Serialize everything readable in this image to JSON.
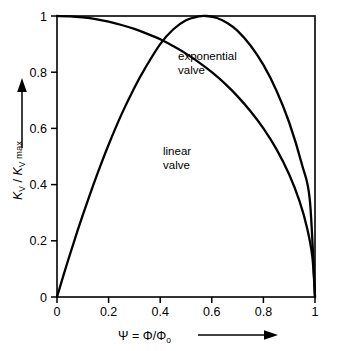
{
  "chart_data": {
    "type": "line",
    "title": "",
    "xlabel": "Ψ = Φ/Φ₀",
    "ylabel": "Kᵥ / Kᵥ max",
    "xlim": [
      0,
      1
    ],
    "ylim": [
      0,
      1
    ],
    "grid": false,
    "legend_position": "inline-annotations",
    "xticks": [
      "0",
      "0.2",
      "0.4",
      "0.6",
      "0.8",
      "1"
    ],
    "xtick_values": [
      0,
      0.2,
      0.4,
      0.6,
      0.8,
      1
    ],
    "yticks": [
      "0",
      "0.2",
      "0.4",
      "0.6",
      "0.8",
      "1"
    ],
    "ytick_values": [
      0,
      0.2,
      0.4,
      0.6,
      0.8,
      1
    ],
    "annotations": [
      {
        "text_line1": "exponential",
        "text_line2": "valve",
        "x": 0.47,
        "y": 0.885
      },
      {
        "text_line1": "linear",
        "text_line2": "valve",
        "x": 0.42,
        "y": 0.53
      }
    ],
    "series": [
      {
        "name": "linear valve",
        "label_line1": "linear",
        "label_line2": "valve",
        "color": "#000000",
        "x": [
          0.0,
          0.05,
          0.1,
          0.15,
          0.2,
          0.25,
          0.3,
          0.34,
          0.4,
          0.45,
          0.5,
          0.55,
          0.6,
          0.65,
          0.7,
          0.75,
          0.8,
          0.85,
          0.9,
          0.94,
          0.97,
          0.99,
          1.0
        ],
        "y": [
          1.0,
          0.999,
          0.995,
          0.989,
          0.98,
          0.968,
          0.954,
          0.94,
          0.917,
          0.893,
          0.866,
          0.835,
          0.8,
          0.76,
          0.714,
          0.661,
          0.6,
          0.527,
          0.436,
          0.341,
          0.243,
          0.141,
          0.0
        ]
      },
      {
        "name": "exponential valve",
        "label_line1": "exponential",
        "label_line2": "valve",
        "color": "#000000",
        "x": [
          0.0,
          0.04,
          0.08,
          0.12,
          0.16,
          0.2,
          0.25,
          0.3,
          0.34,
          0.4,
          0.45,
          0.5,
          0.55,
          0.58,
          0.62,
          0.66,
          0.7,
          0.75,
          0.8,
          0.85,
          0.9,
          0.95,
          0.98,
          1.0
        ],
        "y": [
          0.0,
          0.122,
          0.237,
          0.345,
          0.447,
          0.542,
          0.65,
          0.745,
          0.812,
          0.9,
          0.952,
          0.985,
          0.999,
          1.0,
          0.993,
          0.975,
          0.947,
          0.895,
          0.826,
          0.736,
          0.621,
          0.47,
          0.345,
          0.0
        ]
      }
    ]
  },
  "axes": {
    "y_label_parts": {
      "k1": "K",
      "v1": "V",
      "slash": "/",
      "k2": "K",
      "v2": "V",
      "max": "max"
    },
    "x_label_parts": {
      "psi": "Ψ",
      "eq": "=",
      "phi": "Φ",
      "slash": "/",
      "phi0": "Φ",
      "zero": "o"
    },
    "x_arrow": "arrow-right",
    "y_arrow": "arrow-up"
  }
}
